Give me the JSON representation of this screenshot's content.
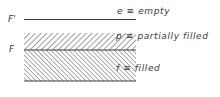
{
  "diagram": {
    "left_labels": {
      "top_level": "F'",
      "mid_level": "F"
    },
    "legend": [
      {
        "symbol": "e",
        "relation": "≡",
        "meaning": "empty",
        "text": "e ≡ empty"
      },
      {
        "symbol": "p",
        "relation": "≡",
        "meaning": "partially filled",
        "text": "p ≡ partially filled"
      },
      {
        "symbol": "f",
        "relation": "≡",
        "meaning": "filled",
        "text": "f ≡ filled"
      }
    ],
    "regions": [
      {
        "name": "empty",
        "fill": "none"
      },
      {
        "name": "partially filled",
        "fill": "sparse forward hatch"
      },
      {
        "name": "filled",
        "fill": "dense backward hatch"
      }
    ],
    "colors": {
      "line": "#3a3a3a",
      "hatch": "#4a4a4a",
      "background": "#ffffff"
    }
  }
}
